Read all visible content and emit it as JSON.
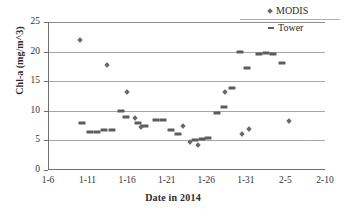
{
  "chart_data": {
    "type": "scatter",
    "title": "",
    "xlabel": "Date in 2014",
    "ylabel": "Chl-a (mg/m^3)",
    "xtick_labels": [
      "1-6",
      "1-11",
      "1-16",
      "1-21",
      "1-26",
      "1-31",
      "2-5",
      "2-10"
    ],
    "ytick_labels": [
      "0",
      "5",
      "10",
      "15",
      "20",
      "25"
    ],
    "ylim": [
      0,
      25
    ],
    "ytick_values": [
      0,
      5,
      10,
      15,
      20,
      25
    ],
    "xlim_days": [
      0,
      35
    ],
    "xtick_days": [
      0,
      5,
      10,
      15,
      20,
      25,
      30,
      35
    ],
    "grid": "horizontal",
    "legend_position": "top-right",
    "colors": {
      "modis_marker": "#6a6a6a",
      "tower_marker": "#5d5d5d",
      "gridline": "#a6a6a6",
      "axis": "#6f6f6f",
      "background": "#ffffff",
      "text": "#333333"
    },
    "series": [
      {
        "name": "MODIS",
        "marker": "diamond",
        "points": [
          {
            "x": 4.0,
            "y": 21.9
          },
          {
            "x": 7.5,
            "y": 17.7
          },
          {
            "x": 10.0,
            "y": 13.1
          },
          {
            "x": 11.0,
            "y": 8.8
          },
          {
            "x": 11.8,
            "y": 7.2
          },
          {
            "x": 17.0,
            "y": 7.4
          },
          {
            "x": 17.9,
            "y": 4.7
          },
          {
            "x": 19.0,
            "y": 4.2
          },
          {
            "x": 22.4,
            "y": 13.2
          },
          {
            "x": 24.5,
            "y": 6.0
          },
          {
            "x": 25.4,
            "y": 6.9
          },
          {
            "x": 30.5,
            "y": 8.3
          }
        ]
      },
      {
        "name": "Tower",
        "marker": "dash",
        "points": [
          {
            "x": 4.3,
            "y": 8.0
          },
          {
            "x": 5.3,
            "y": 6.5
          },
          {
            "x": 6.2,
            "y": 6.5
          },
          {
            "x": 7.1,
            "y": 6.8
          },
          {
            "x": 8.1,
            "y": 6.8
          },
          {
            "x": 9.2,
            "y": 9.9
          },
          {
            "x": 9.8,
            "y": 9.0
          },
          {
            "x": 11.4,
            "y": 7.9
          },
          {
            "x": 12.3,
            "y": 7.5
          },
          {
            "x": 13.6,
            "y": 8.4
          },
          {
            "x": 14.5,
            "y": 8.4
          },
          {
            "x": 15.5,
            "y": 6.7
          },
          {
            "x": 16.4,
            "y": 6.1
          },
          {
            "x": 18.6,
            "y": 5.0
          },
          {
            "x": 19.4,
            "y": 5.3
          },
          {
            "x": 20.2,
            "y": 5.4
          },
          {
            "x": 21.3,
            "y": 9.7
          },
          {
            "x": 22.2,
            "y": 10.7
          },
          {
            "x": 23.3,
            "y": 13.8
          },
          {
            "x": 24.3,
            "y": 19.9
          },
          {
            "x": 25.2,
            "y": 17.3
          },
          {
            "x": 26.6,
            "y": 19.6
          },
          {
            "x": 27.5,
            "y": 19.8
          },
          {
            "x": 28.4,
            "y": 19.6
          },
          {
            "x": 29.6,
            "y": 18.0
          }
        ]
      }
    ],
    "legend": [
      {
        "label": "MODIS",
        "marker": "diamond"
      },
      {
        "label": "Tower",
        "marker": "dash"
      }
    ]
  }
}
